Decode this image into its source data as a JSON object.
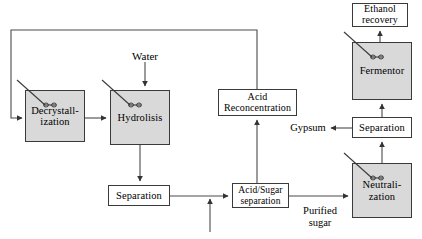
{
  "diagram": {
    "type": "process-flow-diagram",
    "background_color": "#ffffff",
    "line_color": "#4a4a4a",
    "vessel_fill": "#d9d9d9",
    "plain_fill": "#ffffff",
    "nodes": [
      {
        "id": "decrystallization",
        "label": "Decrystall-\nization",
        "kind": "vessel",
        "has_agitator": true,
        "x": 25,
        "y": 90,
        "w": 60,
        "h": 52,
        "font_size": 10.5
      },
      {
        "id": "hydrolisis",
        "label": "Hydrolisis",
        "kind": "vessel",
        "has_agitator": true,
        "x": 110,
        "y": 90,
        "w": 60,
        "h": 55,
        "font_size": 10.5
      },
      {
        "id": "separation-left",
        "label": "Separation",
        "kind": "plain",
        "has_agitator": false,
        "x": 108,
        "y": 185,
        "w": 62,
        "h": 21,
        "font_size": 10.5
      },
      {
        "id": "acid-reconcentration",
        "label": "Acid\nReconcentration",
        "kind": "plain",
        "has_agitator": false,
        "x": 218,
        "y": 89,
        "w": 79,
        "h": 27,
        "font_size": 10
      },
      {
        "id": "acid-sugar-separation",
        "label": "Acid/Sugar\nseparation",
        "kind": "plain",
        "has_agitator": false,
        "x": 232,
        "y": 183,
        "w": 57,
        "h": 25,
        "font_size": 9.5
      },
      {
        "id": "neutralization",
        "label": "Neutrali-\nzation",
        "kind": "vessel",
        "has_agitator": true,
        "x": 352,
        "y": 163,
        "w": 60,
        "h": 55,
        "font_size": 10.5
      },
      {
        "id": "separation-right",
        "label": "Separation",
        "kind": "plain",
        "has_agitator": false,
        "x": 352,
        "y": 117,
        "w": 60,
        "h": 21,
        "font_size": 10.5
      },
      {
        "id": "fermentor",
        "label": "Fermentor",
        "kind": "vessel",
        "has_agitator": true,
        "x": 352,
        "y": 42,
        "w": 60,
        "h": 58,
        "font_size": 10.5
      },
      {
        "id": "ethanol-recovery",
        "label": "Ethanol\nrecovery",
        "kind": "plain",
        "has_agitator": false,
        "x": 352,
        "y": 3,
        "w": 56,
        "h": 24,
        "font_size": 10
      }
    ],
    "stream_labels": [
      {
        "id": "water",
        "text": "Water",
        "x": 123,
        "y": 50,
        "w": 44,
        "font_size": 11
      },
      {
        "id": "gypsum",
        "text": "Gypsum",
        "x": 286,
        "y": 122,
        "w": 44,
        "font_size": 10.5
      },
      {
        "id": "purified-sugar",
        "text": "Purified\nsugar",
        "x": 296,
        "y": 205,
        "w": 48,
        "font_size": 10.5
      }
    ],
    "connections": [
      {
        "id": "recycle-loop",
        "from": "acid-reconcentration-top",
        "to": "decrystallization-left",
        "kind": "recycle",
        "arrow": true
      },
      {
        "id": "decrystallization-to-hydrolisis",
        "from": "decrystallization",
        "to": "hydrolisis",
        "arrow": true
      },
      {
        "id": "water-to-hydrolisis",
        "from": "water",
        "to": "hydrolisis",
        "arrow": true
      },
      {
        "id": "hydrolisis-to-separation-left",
        "from": "hydrolisis",
        "to": "separation-left",
        "arrow": true
      },
      {
        "id": "separation-left-to-acid-sugar",
        "from": "separation-left",
        "to": "acid-sugar-separation",
        "arrow": true
      },
      {
        "id": "feed-up-into-main-line",
        "from": "external-feed",
        "to": "separation-left-to-acid-sugar",
        "arrow": true
      },
      {
        "id": "acid-sugar-to-acid-reconcentration",
        "from": "acid-sugar-separation",
        "to": "acid-reconcentration",
        "arrow": true
      },
      {
        "id": "acid-sugar-to-neutralization",
        "from": "acid-sugar-separation",
        "to": "neutralization",
        "arrow": true,
        "label": "purified-sugar"
      },
      {
        "id": "neutralization-to-separation-right",
        "from": "neutralization",
        "to": "separation-right",
        "arrow": true
      },
      {
        "id": "separation-right-to-gypsum",
        "from": "separation-right",
        "to": "gypsum",
        "arrow": true
      },
      {
        "id": "separation-right-to-fermentor",
        "from": "separation-right",
        "to": "fermentor",
        "arrow": true
      },
      {
        "id": "fermentor-to-ethanol-recovery",
        "from": "fermentor",
        "to": "ethanol-recovery",
        "arrow": true
      }
    ]
  }
}
